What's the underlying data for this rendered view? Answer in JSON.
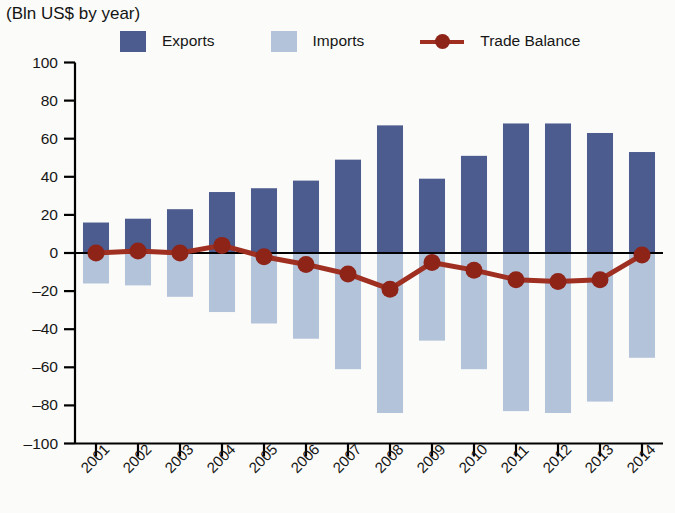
{
  "header": {
    "title_partial": "Exports, Imports and Trade Balance",
    "subtitle": "(Bln US$ by year)"
  },
  "legend": {
    "exports_label": "Exports",
    "imports_label": "Imports",
    "balance_label": "Trade Balance"
  },
  "colors": {
    "exports": "#4d5c8e",
    "imports": "#b3c3da",
    "balance_line": "#9e2f21",
    "balance_marker": "#8e2318",
    "axis": "#000000",
    "background": "#fbfbf9"
  },
  "axis": {
    "y_ticks": [
      "100",
      "80",
      "60",
      "40",
      "20",
      "0",
      "–20",
      "–40",
      "–60",
      "–80",
      "–100"
    ],
    "x_ticks": [
      "2001",
      "2002",
      "2003",
      "2004",
      "2005",
      "2006",
      "2007",
      "2008",
      "2009",
      "2010",
      "2011",
      "2012",
      "2013",
      "2014"
    ]
  },
  "chart_data": {
    "type": "bar",
    "title": "Exports, Imports and Trade Balance",
    "subtitle": "(Bln US$ by year)",
    "xlabel": "",
    "ylabel": "Bln US$ by year",
    "ylim": [
      -100,
      100
    ],
    "ytick_values": [
      100,
      80,
      60,
      40,
      20,
      0,
      -20,
      -40,
      -60,
      -80,
      -100
    ],
    "grid": false,
    "legend_position": "top",
    "categories": [
      "2001",
      "2002",
      "2003",
      "2004",
      "2005",
      "2006",
      "2007",
      "2008",
      "2009",
      "2010",
      "2011",
      "2012",
      "2013",
      "2014"
    ],
    "series": [
      {
        "name": "Exports",
        "type": "bar",
        "color": "#4d5c8e",
        "values": [
          16,
          18,
          23,
          32,
          34,
          38,
          49,
          67,
          39,
          51,
          68,
          68,
          63,
          53
        ]
      },
      {
        "name": "Imports",
        "type": "bar",
        "color": "#b3c3da",
        "values": [
          -16,
          -17,
          -23,
          -31,
          -37,
          -45,
          -61,
          -84,
          -46,
          -61,
          -83,
          -84,
          -78,
          -55
        ]
      },
      {
        "name": "Trade Balance",
        "type": "line",
        "color": "#9e2f21",
        "values": [
          0,
          1,
          0,
          4,
          -2,
          -6,
          -11,
          -19,
          -5,
          -9,
          -14,
          -15,
          -14,
          -1
        ]
      }
    ]
  }
}
